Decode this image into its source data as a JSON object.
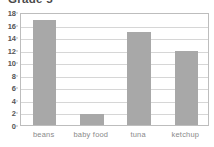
{
  "chart_data": {
    "type": "bar",
    "title": "Grade 5",
    "xlabel": "",
    "ylabel": "",
    "categories": [
      "beans",
      "baby food",
      "tuna",
      "ketchup"
    ],
    "values": [
      16.8,
      1.8,
      14.8,
      11.8
    ],
    "ylim": [
      0,
      18
    ],
    "ytick_labels": [
      "0",
      "2",
      "4",
      "6",
      "8",
      "10",
      "12",
      "14",
      "16",
      "18"
    ],
    "ytick_values": [
      0,
      2,
      4,
      6,
      8,
      10,
      12,
      14,
      16,
      18
    ],
    "grid": true,
    "legend": null,
    "legend_position": "none",
    "series": [
      {
        "name": "count",
        "values": [
          16.8,
          1.8,
          14.8,
          11.8
        ]
      }
    ],
    "colors": {
      "bar_fill": "#a8a8a8",
      "gridline": "#d6d6d6",
      "plot_border": "#bdbdbd",
      "title_text": "#4a4a4a",
      "ytick_text": "#555555",
      "xtick_text": "#8a8a8a",
      "background": "#ffffff"
    }
  }
}
